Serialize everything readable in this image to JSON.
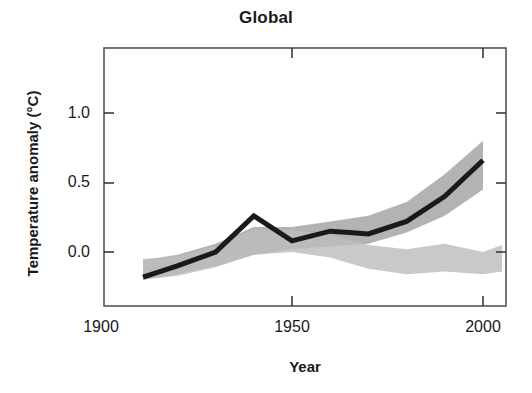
{
  "chart_data": {
    "type": "line",
    "title": "Global",
    "xlabel": "Year",
    "ylabel": "Temperature anomaly (°C)",
    "xlim": [
      1900,
      2005
    ],
    "ylim": [
      -0.45,
      1.35
    ],
    "grid": false,
    "legend": "none",
    "x_ticks": [
      1900,
      1950,
      2000
    ],
    "x_tick_labels": [
      "1900",
      "1950",
      "2000"
    ],
    "y_ticks": [
      0.0,
      0.5,
      1.0
    ],
    "y_tick_labels": [
      "0.0",
      "0.5",
      "1.0"
    ],
    "x": [
      1911,
      1920,
      1930,
      1940,
      1950,
      1960,
      1970,
      1980,
      1990,
      2000
    ],
    "series": [
      {
        "name": "Observations",
        "type": "line",
        "color": "#1a1a1a",
        "linewidth": 5,
        "values": [
          -0.18,
          -0.1,
          0.0,
          0.26,
          0.08,
          0.15,
          0.14,
          0.13,
          0.22,
          0.4,
          0.66
        ],
        "x_values": [
          1911,
          1920,
          1930,
          1940,
          1950,
          1960,
          1965,
          1970,
          1980,
          1990,
          2000
        ]
      },
      {
        "name": "Models using both natural and anthropogenic forcings",
        "type": "band",
        "color": "#a8a8a8",
        "opacity": 0.85,
        "x_values": [
          1911,
          1920,
          1930,
          1940,
          1950,
          1960,
          1970,
          1980,
          1990,
          2000
        ],
        "upper": [
          -0.06,
          -0.02,
          0.06,
          0.18,
          0.18,
          0.22,
          0.26,
          0.36,
          0.56,
          0.8
        ],
        "lower": [
          -0.2,
          -0.16,
          -0.1,
          -0.02,
          0.02,
          0.04,
          0.06,
          0.14,
          0.26,
          0.45
        ]
      },
      {
        "name": "Models using only natural forcings",
        "type": "band",
        "color": "#bdbdbd",
        "opacity": 0.85,
        "x_values": [
          1911,
          1920,
          1930,
          1940,
          1950,
          1960,
          1970,
          1980,
          1990,
          2000
        ],
        "upper": [
          -0.05,
          -0.03,
          0.04,
          0.16,
          0.16,
          0.12,
          0.05,
          0.02,
          0.06,
          0.0,
          0.05
        ],
        "lower": [
          -0.2,
          -0.17,
          -0.11,
          -0.02,
          0.0,
          -0.04,
          -0.12,
          -0.16,
          -0.14,
          -0.16,
          -0.14
        ]
      }
    ]
  },
  "figure": {
    "title": "Global",
    "x_axis_title": "Year",
    "y_axis_title": "Temperature anomaly (°C)",
    "y_tick_0": "0.0",
    "y_tick_1": "0.5",
    "y_tick_2": "1.0",
    "x_tick_0": "1900",
    "x_tick_1": "1950",
    "x_tick_2": "2000"
  },
  "style": {
    "line_color": "#1a1a1a",
    "band_upper_color": "#a6a6a6",
    "band_lower_color": "#bcbcbc",
    "band_overlap_color": "#8f8f8f",
    "frame_color": "#555555",
    "background": "#ffffff"
  }
}
